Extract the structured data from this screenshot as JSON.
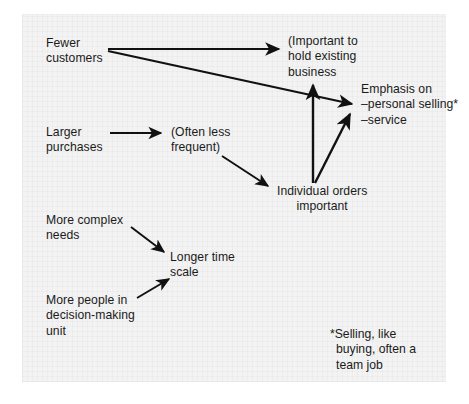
{
  "diagram": {
    "type": "influence-flow-diagram",
    "background_color": "#f3f3f3",
    "text_color": "#1b1b1b",
    "arrow_color": "#111111",
    "nodes": [
      {
        "id": "fewer-customers",
        "label": "Fewer\ncustomers",
        "x": 46,
        "y": 36
      },
      {
        "id": "important-hold-business",
        "label": "(Important to\nhold existing\n   business",
        "x": 288,
        "y": 34
      },
      {
        "id": "emphasis-on",
        "label": "Emphasis on\n–personal selling*\n–service",
        "x": 361,
        "y": 82
      },
      {
        "id": "larger-purchases",
        "label": "Larger\npurchases",
        "x": 46,
        "y": 125
      },
      {
        "id": "often-less-frequent",
        "label": "(Often less\nfrequent)",
        "x": 171,
        "y": 125
      },
      {
        "id": "individual-orders",
        "label": "Individual orders\nimportant",
        "x": 277,
        "y": 184
      },
      {
        "id": "more-complex-needs",
        "label": "More complex\nneeds",
        "x": 46,
        "y": 213
      },
      {
        "id": "longer-time-scale",
        "label": "Longer time\nscale",
        "x": 170,
        "y": 250
      },
      {
        "id": "more-people-dmu",
        "label": "More people in\ndecision-making\nunit",
        "x": 46,
        "y": 293
      }
    ],
    "footnote": {
      "id": "selling-footnote",
      "label": "*Selling, like\n buying, often a\n team job",
      "x": 330,
      "y": 327
    },
    "edges": [
      {
        "id": "edge-fewer-to-important",
        "from": "fewer-customers",
        "to": "important-hold-business",
        "path": "M 108 49 L 279 49"
      },
      {
        "id": "edge-fewer-to-emphasis",
        "from": "fewer-customers",
        "to": "emphasis-on",
        "path": "M 108 50 L 353 104"
      },
      {
        "id": "edge-larger-to-often",
        "from": "larger-purchases",
        "to": "often-less-frequent",
        "path": "M 110 133 L 162 133"
      },
      {
        "id": "edge-often-to-individual",
        "from": "often-less-frequent",
        "to": "individual-orders",
        "path": "M 223 156 L 269 185"
      },
      {
        "id": "edge-individual-to-important",
        "from": "individual-orders",
        "to": "important-hold-business",
        "path": "M 313 182 L 313 84"
      },
      {
        "id": "edge-individual-to-emphasis",
        "from": "individual-orders",
        "to": "emphasis-on",
        "path": "M 315 182 L 350 114"
      },
      {
        "id": "edge-complex-to-longer",
        "from": "more-complex-needs",
        "to": "longer-time-scale",
        "path": "M 131 228 L 165 253"
      },
      {
        "id": "edge-dmu-to-longer",
        "from": "more-people-dmu",
        "to": "longer-time-scale",
        "path": "M 138 297 L 170 280"
      }
    ]
  }
}
